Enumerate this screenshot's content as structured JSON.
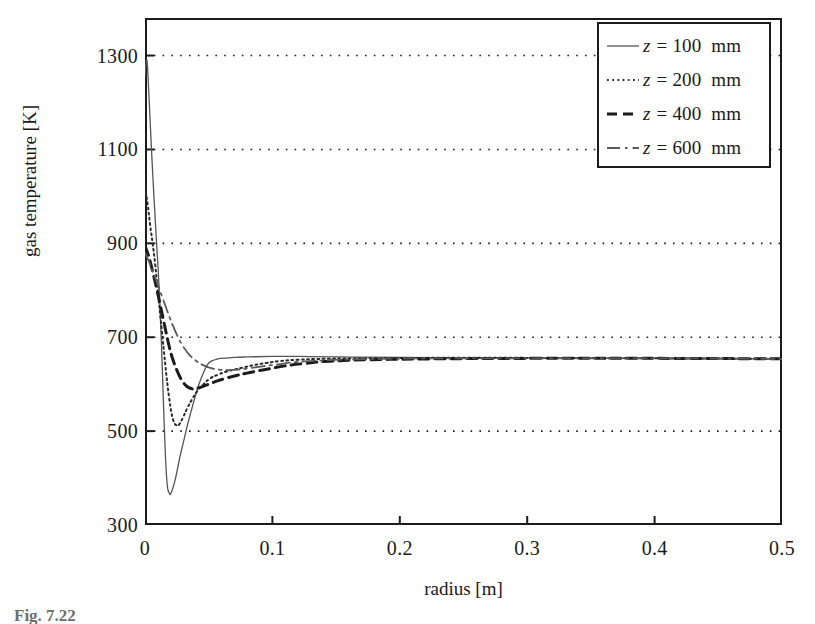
{
  "figure": {
    "caption": "Fig. 7.22"
  },
  "chart_data": {
    "type": "line",
    "title": "",
    "xlabel": "radius [m]",
    "ylabel": "gas temperature [K]",
    "xlim": [
      0,
      0.5
    ],
    "ylim": [
      300,
      1380
    ],
    "xticks": [
      "0",
      "0.1",
      "0.2",
      "0.3",
      "0.4",
      "0.5"
    ],
    "xtick_values": [
      0,
      0.1,
      0.2,
      0.3,
      0.4,
      0.5
    ],
    "yticks": [
      "300",
      "500",
      "700",
      "900",
      "1100",
      "1300"
    ],
    "ytick_values": [
      300,
      500,
      700,
      900,
      1100,
      1300
    ],
    "grid": "horizontal-dotted",
    "legend_position": "top-right",
    "series": [
      {
        "name": "z = 100 mm",
        "z_value": "100",
        "unit": "mm",
        "style": "solid-thin",
        "color": "#555555",
        "x": [
          0.0,
          0.0015,
          0.003,
          0.005,
          0.007,
          0.009,
          0.011,
          0.013,
          0.015,
          0.017,
          0.019,
          0.021,
          0.024,
          0.027,
          0.03,
          0.034,
          0.038,
          0.042,
          0.046,
          0.05,
          0.055,
          0.06,
          0.07,
          0.08,
          0.1,
          0.12,
          0.15,
          0.2,
          0.3,
          0.4,
          0.5
        ],
        "y": [
          1255,
          1290,
          1220,
          1105,
          1000,
          905,
          810,
          680,
          520,
          400,
          368,
          372,
          400,
          440,
          475,
          520,
          560,
          597,
          625,
          645,
          652,
          655,
          657,
          658,
          659,
          659,
          658,
          657,
          656,
          655,
          654
        ]
      },
      {
        "name": "z = 200 mm",
        "z_value": "200",
        "unit": "mm",
        "style": "dotted",
        "color": "#2b2b2b",
        "x": [
          0.0,
          0.002,
          0.004,
          0.006,
          0.008,
          0.01,
          0.013,
          0.016,
          0.019,
          0.022,
          0.025,
          0.027,
          0.03,
          0.033,
          0.037,
          0.041,
          0.046,
          0.051,
          0.057,
          0.063,
          0.07,
          0.078,
          0.086,
          0.095,
          0.105,
          0.12,
          0.14,
          0.17,
          0.22,
          0.3,
          0.4,
          0.5
        ],
        "y": [
          1020,
          985,
          940,
          900,
          855,
          800,
          720,
          640,
          570,
          525,
          512,
          515,
          530,
          548,
          568,
          585,
          600,
          612,
          620,
          626,
          631,
          636,
          641,
          645,
          649,
          652,
          654,
          655,
          656,
          656,
          655,
          654
        ]
      },
      {
        "name": "z = 400 mm",
        "z_value": "400",
        "unit": "mm",
        "style": "dashed",
        "color": "#1b1b1b",
        "x": [
          0.0,
          0.002,
          0.004,
          0.006,
          0.009,
          0.012,
          0.015,
          0.018,
          0.021,
          0.025,
          0.029,
          0.033,
          0.037,
          0.042,
          0.047,
          0.052,
          0.058,
          0.064,
          0.071,
          0.079,
          0.088,
          0.098,
          0.11,
          0.125,
          0.145,
          0.175,
          0.23,
          0.31,
          0.4,
          0.5
        ],
        "y": [
          895,
          880,
          862,
          840,
          805,
          768,
          730,
          692,
          660,
          630,
          608,
          595,
          590,
          592,
          597,
          602,
          608,
          613,
          618,
          623,
          628,
          633,
          639,
          644,
          649,
          652,
          654,
          655,
          655,
          654
        ]
      },
      {
        "name": "z = 600 mm",
        "z_value": "600",
        "unit": "mm",
        "style": "dash-dot",
        "color": "#5a5a5a",
        "x": [
          0.0,
          0.003,
          0.006,
          0.01,
          0.014,
          0.018,
          0.022,
          0.026,
          0.03,
          0.035,
          0.04,
          0.046,
          0.052,
          0.058,
          0.065,
          0.073,
          0.082,
          0.092,
          0.104,
          0.118,
          0.136,
          0.165,
          0.22,
          0.3,
          0.4,
          0.5
        ],
        "y": [
          880,
          862,
          840,
          812,
          782,
          752,
          724,
          700,
          680,
          662,
          650,
          640,
          634,
          631,
          630,
          631,
          634,
          638,
          642,
          647,
          650,
          653,
          655,
          655,
          655,
          654
        ]
      }
    ]
  }
}
